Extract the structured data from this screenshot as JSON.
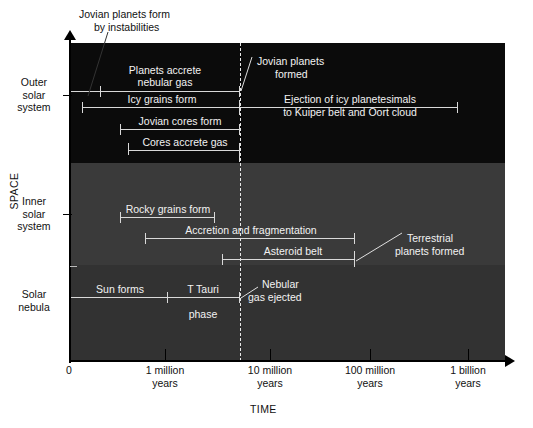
{
  "axes": {
    "y_title": "SPACE",
    "x_title": "TIME",
    "x_ticks": [
      {
        "label": "0",
        "x": 70
      },
      {
        "label": "1 million\nyears",
        "line1": "1 million",
        "line2": "years",
        "x": 165
      },
      {
        "label": "10 million\nyears",
        "line1": "10 million",
        "line2": "years",
        "x": 270
      },
      {
        "label": "100 million\nyears",
        "line1": "100 million",
        "line2": "years",
        "x": 370
      },
      {
        "label": "1 billion\nyears",
        "line1": "1 billion",
        "line2": "years",
        "x": 468
      }
    ],
    "regions": [
      {
        "name": "outer-solar-system",
        "line1": "Outer",
        "line2": "solar",
        "line3": "system"
      },
      {
        "name": "inner-solar-system",
        "line1": "Inner",
        "line2": "solar",
        "line3": "system"
      },
      {
        "name": "solar-nebula",
        "line1": "Solar",
        "line2": "nebula"
      }
    ]
  },
  "bars": {
    "planets_accrete": {
      "line1": "Planets accrete",
      "line2": "nebular gas"
    },
    "icy_grains": {
      "label": "Icy grains form"
    },
    "ejection": {
      "line1": "Ejection of icy planetesimals",
      "line2": "to Kuiper belt and Oort cloud"
    },
    "jovian_cores": {
      "label": "Jovian cores form"
    },
    "cores_accrete": {
      "label": "Cores accrete gas"
    },
    "rocky_grains": {
      "label": "Rocky grains form"
    },
    "accretion": {
      "label": "Accretion and fragmentation"
    },
    "asteroid_belt": {
      "label": "Asteroid belt"
    },
    "sun_forms": {
      "label": "Sun forms"
    },
    "t_tauri": {
      "line1": "T Tauri",
      "line2": "phase"
    }
  },
  "annotations": {
    "jovian_instabilities": {
      "line1": "Jovian planets form",
      "line2": "by instabilities"
    },
    "jovian_formed": {
      "line1": "Jovian planets",
      "line2": "formed"
    },
    "terrestrial_formed": {
      "line1": "Terrestrial",
      "line2": "planets formed"
    },
    "nebular_gas_ejected": {
      "line1": "Nebular",
      "line2": "gas ejected"
    }
  },
  "colors": {
    "outer_band": "#0b0b0b",
    "inner_band": "#3a3a3a",
    "nebula_band": "#323232",
    "bar": "#d9d9d9",
    "dashed": "#e8e8e8",
    "text_dark": "#111111",
    "text_light": "#f2f2f2"
  }
}
